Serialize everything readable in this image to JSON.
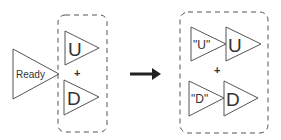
{
  "diagram": {
    "left": {
      "ready_label": "Ready",
      "group": {
        "top_label": "U",
        "operator": "+",
        "bottom_label": "D"
      }
    },
    "arrow": "right-arrow",
    "right": {
      "group": {
        "top_quoted_label": "\"U\"",
        "top_label": "U",
        "operator": "+",
        "bottom_quoted_label": "\"D\"",
        "bottom_label": "D"
      }
    },
    "colors": {
      "stroke": "#555555",
      "text": "#333333",
      "arrow": "#222222"
    }
  }
}
